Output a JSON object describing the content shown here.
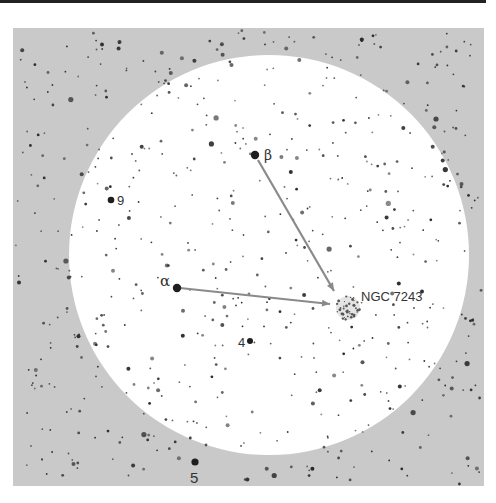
{
  "figure": {
    "title": "",
    "field": {
      "x": 13,
      "y": 28,
      "width": 471,
      "height": 458,
      "color": "#c9c9c9"
    },
    "finder_circle": {
      "cx": 269,
      "cy": 255,
      "r": 200,
      "color": "#ffffff"
    },
    "line_color": "#8a8a8a",
    "star_color": "#2a2a2a"
  },
  "labels": {
    "beta": "β",
    "alpha": "α",
    "ngc": "NGC 7243",
    "nine": "9",
    "four": "4",
    "five": "5"
  },
  "key_stars": [
    {
      "name": "beta",
      "x": 255,
      "y": 155,
      "r": 4.2
    },
    {
      "name": "alpha",
      "x": 177,
      "y": 288,
      "r": 4.2
    },
    {
      "name": "9",
      "x": 111,
      "y": 200,
      "r": 3.3
    },
    {
      "name": "4",
      "x": 250,
      "y": 341,
      "r": 3.0
    },
    {
      "name": "5",
      "x": 195,
      "y": 462,
      "r": 3.6
    }
  ],
  "pointers": [
    {
      "from": "beta",
      "x1": 258,
      "y1": 160,
      "x2": 334,
      "y2": 291
    },
    {
      "from": "alpha",
      "x1": 180,
      "y1": 288,
      "x2": 330,
      "y2": 304
    }
  ],
  "cluster": {
    "name": "NGC 7243",
    "x": 348,
    "y": 308,
    "r": 12
  }
}
